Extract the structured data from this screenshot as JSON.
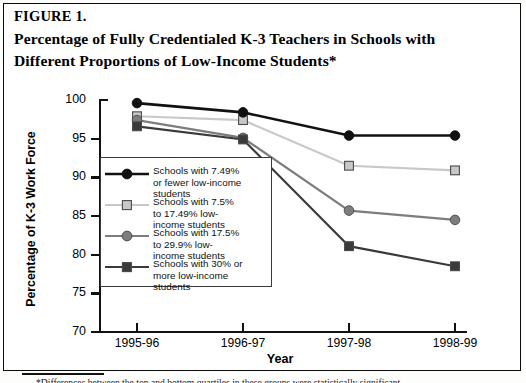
{
  "figure": {
    "label": "FIGURE 1.",
    "title_line1": "Percentage of Fully Credentialed K-3 Teachers in Schools with",
    "title_line2": "Different Proportions of Low-Income Students*",
    "footnote": "*Differences between the top and bottom quartiles in these groups were statistically significant."
  },
  "chart_data": {
    "type": "line",
    "title": "Percentage of Fully Credentialed K-3 Teachers in Schools with Different Proportions of Low-Income Students*",
    "xlabel": "Year",
    "ylabel": "Percentage of K-3 Work Force",
    "categories": [
      "1995-96",
      "1996-97",
      "1997-98",
      "1998-99"
    ],
    "ylim": [
      70,
      100
    ],
    "yticks": [
      70,
      75,
      80,
      85,
      90,
      95,
      100
    ],
    "grid": false,
    "legend_position": "inside-left",
    "series": [
      {
        "name": "Schools with 7.49% or fewer low-income students",
        "legend_line1": "Schools with 7.49%",
        "legend_line2": "or fewer low-income",
        "legend_line3": "students",
        "marker": "circle",
        "color": "#111111",
        "values": [
          99.6,
          98.4,
          95.4,
          95.4
        ]
      },
      {
        "name": "Schools with 7.5% to 17.49% low-income students",
        "legend_line1": "Schools with 7.5%",
        "legend_line2": "to 17.49% low-",
        "legend_line3": "income students",
        "marker": "square",
        "color": "#c8c8c8",
        "values": [
          97.9,
          97.4,
          91.5,
          90.9
        ]
      },
      {
        "name": "Schools with 17.5% to 29.9% low-income students",
        "legend_line1": "Schools with 17.5%",
        "legend_line2": "to 29.9% low-",
        "legend_line3": "income students",
        "marker": "circle",
        "color": "#7d7d7d",
        "values": [
          97.4,
          95.1,
          85.7,
          84.5
        ]
      },
      {
        "name": "Schools with 30% or more low-income students",
        "legend_line1": "Schools with 30% or",
        "legend_line2": "more low-income",
        "legend_line3": "students",
        "marker": "square",
        "color": "#3a3a3a",
        "values": [
          96.6,
          94.9,
          81.1,
          78.5
        ]
      }
    ]
  },
  "axis": {
    "ytick_labels": [
      "100",
      "95",
      "90",
      "85",
      "80",
      "75",
      "70"
    ],
    "xtick_labels": [
      "1995-96",
      "1996-97",
      "1997-98",
      "1998-99"
    ]
  }
}
